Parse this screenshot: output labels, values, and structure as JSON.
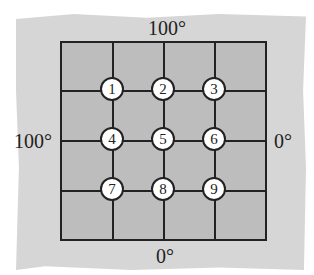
{
  "diagram": {
    "boundary_temps": {
      "top": "100°",
      "left": "100°",
      "right": "0°",
      "bottom": "0°"
    },
    "nodes": [
      {
        "label": "1"
      },
      {
        "label": "2"
      },
      {
        "label": "3"
      },
      {
        "label": "4"
      },
      {
        "label": "5"
      },
      {
        "label": "6"
      },
      {
        "label": "7"
      },
      {
        "label": "8"
      },
      {
        "label": "9"
      }
    ],
    "grid": {
      "rows": 4,
      "cols": 4
    },
    "colors": {
      "plate": "#bdbdbd",
      "background": "#d6d6d6",
      "lines": "#222222",
      "nodes": "#ffffff"
    }
  }
}
